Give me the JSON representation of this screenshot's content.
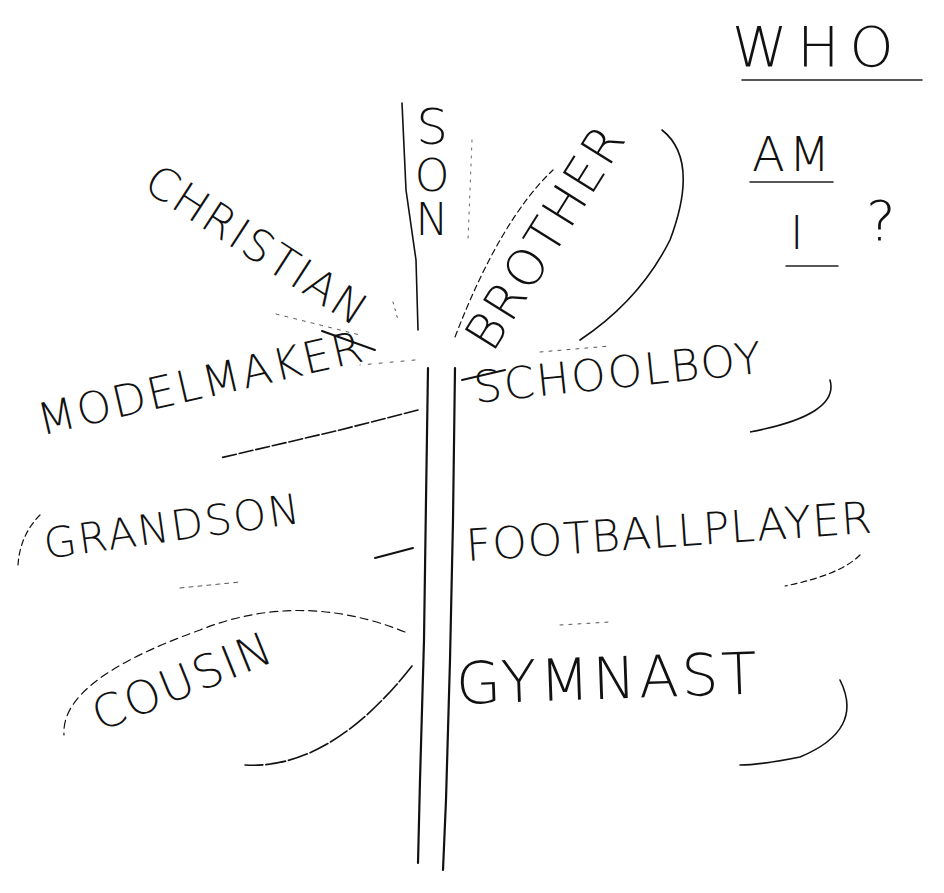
{
  "title": {
    "lines": [
      "WHO",
      "AM",
      "I",
      "?"
    ],
    "full_text": "WHO AM I ?"
  },
  "trunk": {
    "label": "identity tree trunk"
  },
  "branches": {
    "top": [
      {
        "id": "christian",
        "label": "CHRISTIAN"
      },
      {
        "id": "son",
        "label": "SON",
        "letters": [
          "S",
          "O",
          "N"
        ]
      },
      {
        "id": "brother",
        "label": "BROTHER"
      }
    ],
    "left": [
      {
        "id": "model-maker",
        "label": "MODELMAKER"
      },
      {
        "id": "grandson",
        "label": "GRANDSON"
      },
      {
        "id": "cousin",
        "label": "COUSIN"
      }
    ],
    "right": [
      {
        "id": "schoolboy",
        "label": "SCHOOLBOY"
      },
      {
        "id": "football-player",
        "label": "FOOTBALLPLAYER"
      },
      {
        "id": "gymnast",
        "label": "GYMNAST"
      }
    ]
  },
  "colors": {
    "ink": "#111111",
    "paper": "#ffffff",
    "faint": "#555555"
  }
}
